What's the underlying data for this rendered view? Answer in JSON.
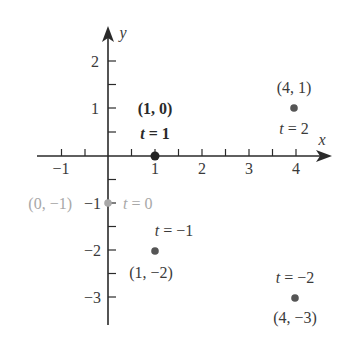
{
  "chart_data": {
    "type": "scatter",
    "title": "",
    "xlabel": "x",
    "ylabel": "y",
    "xlim": [
      -1.5,
      4.6
    ],
    "ylim": [
      -3.6,
      2.7
    ],
    "x_ticks": [
      -1,
      -0.5,
      0.5,
      1,
      1.5,
      2,
      2.5,
      3,
      3.5,
      4
    ],
    "x_tick_labels": [
      "-1",
      "1",
      "2",
      "3",
      "4"
    ],
    "y_ticks": [
      -3,
      -2.5,
      -2,
      -1.5,
      -1,
      -0.5,
      0.5,
      1,
      1.5,
      2
    ],
    "y_tick_labels": [
      "-3",
      "-2",
      "-1",
      "1",
      "2"
    ],
    "grid": false,
    "legend": null,
    "series": [
      {
        "name": "parametric points",
        "points": [
          {
            "t": -2,
            "x": 4,
            "y": -3,
            "coord_label": "(4, −3)",
            "t_label": "t = −2",
            "color": "#555555"
          },
          {
            "t": -1,
            "x": 1,
            "y": -2,
            "coord_label": "(1, −2)",
            "t_label": "t = −1",
            "color": "#555555"
          },
          {
            "t": 0,
            "x": 0,
            "y": -1,
            "coord_label": "(0, −1)",
            "t_label": "t = 0",
            "color": "#a8a8a8"
          },
          {
            "t": 1,
            "x": 1,
            "y": 0,
            "coord_label": "(1, 0)",
            "t_label": "t = 1",
            "color": "#222222"
          },
          {
            "t": 2,
            "x": 4,
            "y": 1,
            "coord_label": "(4, 1)",
            "t_label": "t = 2",
            "color": "#555555"
          }
        ]
      }
    ]
  },
  "axes": {
    "x_label": "x",
    "y_label": "y",
    "x_tick_text": {
      "m1": "−1",
      "p1": "1",
      "p2": "2",
      "p3": "3",
      "p4": "4"
    },
    "y_tick_text": {
      "p2": "2",
      "p1": "1",
      "m1": "−1",
      "m2": "−2",
      "m3": "−3"
    }
  },
  "labels": {
    "p_t1_coord": "(1, 0)",
    "p_t1_t": "t = 1",
    "p_t2_coord": "(4, 1)",
    "p_t2_t": "t = 2",
    "p_t0_coord": "(0, −1)",
    "p_t0_t": "t = 0",
    "p_tm1_t": "t = −1",
    "p_tm1_coord": "(1, −2)",
    "p_tm2_t": "t = −2",
    "p_tm2_coord": "(4, −3)"
  },
  "colors": {
    "axis": "#2a2a2a",
    "point_dark": "#222222",
    "point_mid": "#555555",
    "point_light": "#a8a8a8"
  }
}
